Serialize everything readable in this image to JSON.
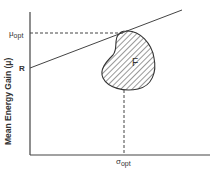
{
  "diagram": {
    "type": "mean-variance feasible region",
    "y_axis_label": "Mean Energy Gain (μ)",
    "x_axis_label": "",
    "labels": {
      "mu_opt_main": "μ",
      "mu_opt_sub": "opt",
      "r": "R",
      "region": "F",
      "sigma_opt_main": "σ",
      "sigma_opt_sub": "opt"
    },
    "colors": {
      "ink": "#333333",
      "background": "#ffffff"
    },
    "elements": [
      "y-axis",
      "x-axis",
      "tangent line from R",
      "feasible region F (hatched blob)",
      "horizontal dashed line at mu_opt",
      "vertical dashed line at sigma_opt"
    ]
  }
}
